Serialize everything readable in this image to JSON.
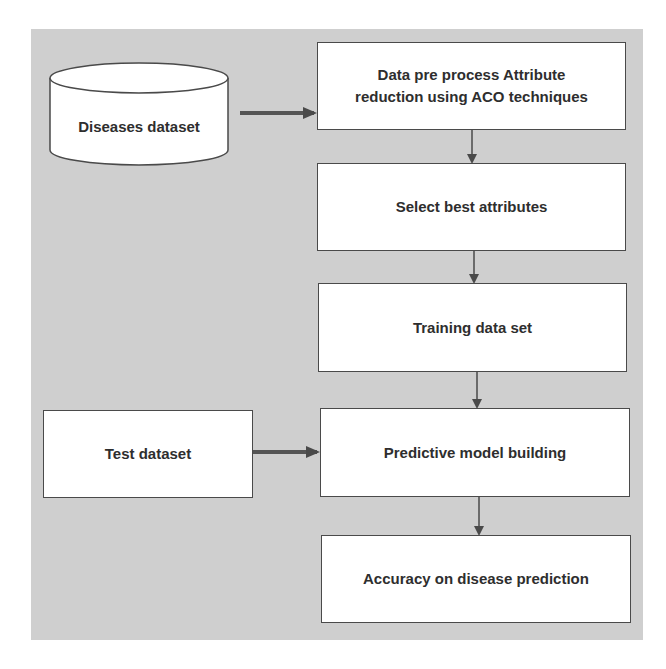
{
  "diagram": {
    "type": "flowchart",
    "background_color": "#cfcfcf",
    "box_fill": "#ffffff",
    "stroke_color": "#4a4a4a",
    "text_color": "#2e2e2e",
    "nodes": [
      {
        "id": "diseases_dataset",
        "shape": "cylinder",
        "label": "Diseases dataset"
      },
      {
        "id": "preprocess",
        "shape": "rect",
        "label_line1": "Data pre process Attribute",
        "label_line2": "reduction using ACO techniques"
      },
      {
        "id": "select_attributes",
        "shape": "rect",
        "label": "Select best attributes"
      },
      {
        "id": "training",
        "shape": "rect",
        "label": "Training data set"
      },
      {
        "id": "test_dataset",
        "shape": "rect",
        "label": "Test dataset"
      },
      {
        "id": "model_building",
        "shape": "rect",
        "label": "Predictive model building"
      },
      {
        "id": "accuracy",
        "shape": "rect",
        "label": "Accuracy on disease prediction"
      }
    ],
    "edges": [
      {
        "from": "diseases_dataset",
        "to": "preprocess"
      },
      {
        "from": "preprocess",
        "to": "select_attributes"
      },
      {
        "from": "select_attributes",
        "to": "training"
      },
      {
        "from": "training",
        "to": "model_building"
      },
      {
        "from": "test_dataset",
        "to": "model_building"
      },
      {
        "from": "model_building",
        "to": "accuracy"
      }
    ]
  }
}
